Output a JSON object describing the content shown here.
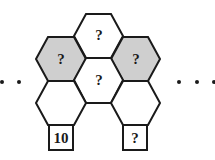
{
  "diagram": {
    "type": "hexagon-number-pattern",
    "colors": {
      "stroke": "#1a1a1a",
      "shaded": "#cfcfcf",
      "white": "#ffffff"
    },
    "cells": {
      "top": "?",
      "left_shaded": "?",
      "right_shaded": "?",
      "center": "?",
      "bottom_left": "",
      "bottom_right": ""
    },
    "boxes": {
      "left": "10",
      "right": "?"
    },
    "ellipsis_left": "dots",
    "ellipsis_right": "dots"
  }
}
